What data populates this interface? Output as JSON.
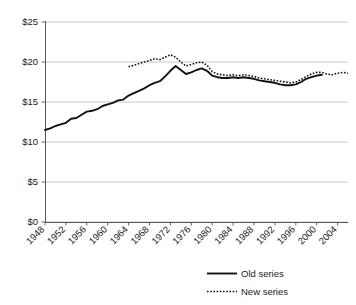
{
  "chart_data": {
    "type": "line",
    "title": "",
    "subtitle": "",
    "xlabel": "",
    "ylabel": "",
    "xlim": [
      1948,
      2006
    ],
    "ylim": [
      0,
      25
    ],
    "ytick_labels": [
      "$0",
      "$5",
      "$10",
      "$15",
      "$20",
      "$25"
    ],
    "ytick_values": [
      0,
      5,
      10,
      15,
      20,
      25
    ],
    "xtick_labels": [
      "1948",
      "1952",
      "1956",
      "1960",
      "1964",
      "1968",
      "1972",
      "1976",
      "1980",
      "1984",
      "1988",
      "1992",
      "1996",
      "2000",
      "2004"
    ],
    "xtick_values": [
      1948,
      1952,
      1956,
      1960,
      1964,
      1968,
      1972,
      1976,
      1980,
      1984,
      1988,
      1992,
      1996,
      2000,
      2004
    ],
    "grid": true,
    "legend_position": "bottom-right",
    "legend": [
      "Old series",
      "New series"
    ],
    "series": [
      {
        "name": "Old series",
        "style": "solid",
        "color": "#111111",
        "x": [
          1948,
          1949,
          1950,
          1951,
          1952,
          1953,
          1954,
          1955,
          1956,
          1957,
          1958,
          1959,
          1960,
          1961,
          1962,
          1963,
          1964,
          1965,
          1966,
          1967,
          1968,
          1969,
          1970,
          1971,
          1972,
          1973,
          1974,
          1975,
          1976,
          1977,
          1978,
          1979,
          1980,
          1981,
          1982,
          1983,
          1984,
          1985,
          1986,
          1987,
          1988,
          1989,
          1990,
          1991,
          1992,
          1993,
          1994,
          1995,
          1996,
          1997,
          1998,
          1999,
          2000,
          2001
        ],
        "values": [
          11.5,
          11.7,
          12.0,
          12.2,
          12.4,
          12.9,
          13.0,
          13.4,
          13.8,
          13.9,
          14.1,
          14.5,
          14.7,
          14.9,
          15.2,
          15.3,
          15.8,
          16.1,
          16.4,
          16.7,
          17.1,
          17.4,
          17.6,
          18.2,
          18.9,
          19.5,
          19.0,
          18.5,
          18.7,
          19.0,
          19.2,
          18.9,
          18.3,
          18.1,
          18.0,
          18.0,
          18.1,
          18.0,
          18.1,
          18.0,
          17.9,
          17.7,
          17.6,
          17.5,
          17.4,
          17.2,
          17.1,
          17.1,
          17.2,
          17.5,
          17.9,
          18.1,
          18.3,
          18.4
        ]
      },
      {
        "name": "New series",
        "style": "dotted",
        "color": "#111111",
        "x": [
          1964,
          1965,
          1966,
          1967,
          1968,
          1969,
          1970,
          1971,
          1972,
          1973,
          1974,
          1975,
          1976,
          1977,
          1978,
          1979,
          1980,
          1981,
          1982,
          1983,
          1984,
          1985,
          1986,
          1987,
          1988,
          1989,
          1990,
          1991,
          1992,
          1993,
          1994,
          1995,
          1996,
          1997,
          1998,
          1999,
          2000,
          2001,
          2002,
          2003,
          2004,
          2005,
          2006
        ],
        "values": [
          19.4,
          19.6,
          19.8,
          20.0,
          20.2,
          20.4,
          20.3,
          20.6,
          20.9,
          20.6,
          20.0,
          19.5,
          19.7,
          19.9,
          20.0,
          19.6,
          18.8,
          18.5,
          18.4,
          18.3,
          18.4,
          18.3,
          18.4,
          18.3,
          18.2,
          18.0,
          17.9,
          17.8,
          17.7,
          17.6,
          17.5,
          17.4,
          17.5,
          17.8,
          18.2,
          18.5,
          18.7,
          18.7,
          18.5,
          18.4,
          18.6,
          18.7,
          18.6
        ]
      }
    ]
  },
  "legend": {
    "items": [
      {
        "label": "Old series",
        "style": "solid"
      },
      {
        "label": "New series",
        "style": "dotted"
      }
    ]
  }
}
